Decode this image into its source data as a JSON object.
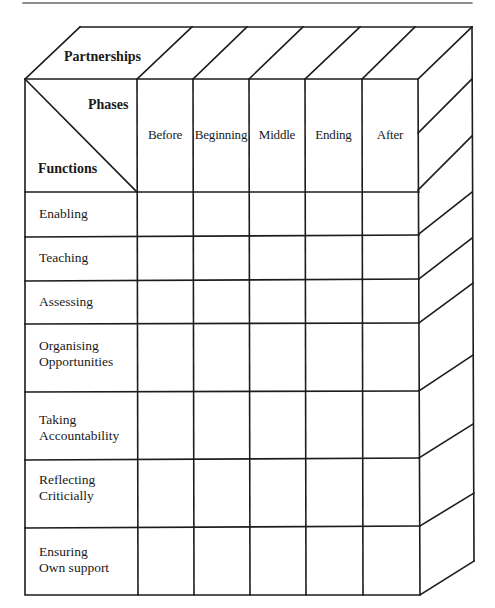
{
  "diagram": {
    "top_face_label": "Partnerships",
    "corner_cell": {
      "top_right_label": "Phases",
      "bottom_left_label": "Functions"
    },
    "phases": [
      {
        "label": "Before"
      },
      {
        "label": "Beginning"
      },
      {
        "label": "Middle"
      },
      {
        "label": "Ending"
      },
      {
        "label": "After"
      }
    ],
    "functions": [
      {
        "line1": "Enabling",
        "line2": ""
      },
      {
        "line1": "Teaching",
        "line2": ""
      },
      {
        "line1": "Assessing",
        "line2": ""
      },
      {
        "line1": "Organising",
        "line2": "Opportunities"
      },
      {
        "line1": "Taking",
        "line2": "Accountability"
      },
      {
        "line1": "Reflecting",
        "line2": "Criticially"
      },
      {
        "line1": "Ensuring",
        "line2": "Own support"
      }
    ],
    "style": {
      "line_color": "#1c1c1c",
      "background": "#ffffff"
    }
  }
}
